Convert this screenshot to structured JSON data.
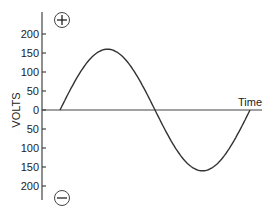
{
  "chart_data": {
    "type": "line",
    "title": "",
    "xlabel": "Time",
    "ylabel": "VOLTS",
    "yticks": [
      "200",
      "150",
      "100",
      "50",
      "0",
      "50",
      "100",
      "150",
      "200"
    ],
    "ytick_values": [
      200,
      150,
      100,
      50,
      0,
      -50,
      -100,
      -150,
      -200
    ],
    "ylim": [
      -230,
      230
    ],
    "grid": false,
    "annotations": [
      "+",
      "−"
    ],
    "series": [
      {
        "name": "AC voltage (one sine cycle)",
        "x": [
          0,
          0.25,
          0.5,
          0.75,
          1.0
        ],
        "values": [
          0,
          160,
          0,
          -160,
          0
        ]
      }
    ]
  },
  "labels": {
    "xlabel": "Time",
    "ylabel": "VOLTS",
    "plus": "+",
    "minus": "−"
  }
}
